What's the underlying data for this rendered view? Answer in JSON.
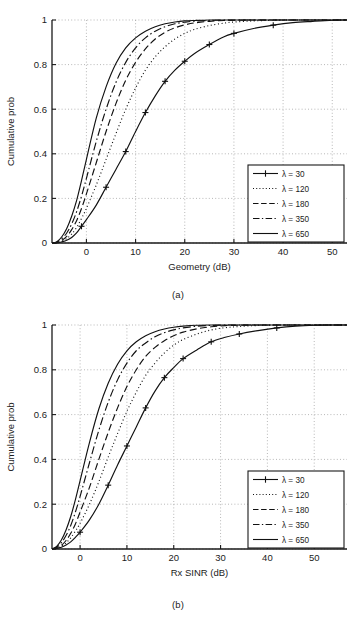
{
  "figure": {
    "panels": [
      {
        "id": "a",
        "caption": "(a)",
        "xlabel": "Geometry (dB)",
        "ylabel": "Cumulative prob",
        "xticks": [
          "0",
          "10",
          "20",
          "30",
          "40",
          "50"
        ],
        "yticks": [
          "0",
          "0.2",
          "0.4",
          "0.6",
          "0.8",
          "1"
        ]
      },
      {
        "id": "b",
        "caption": "(b)",
        "xlabel": "Rx SINR (dB)",
        "ylabel": "Cumulative prob",
        "xticks": [
          "0",
          "10",
          "20",
          "30",
          "40",
          "50"
        ],
        "yticks": [
          "0",
          "0.2",
          "0.4",
          "0.6",
          "0.8",
          "1"
        ]
      }
    ],
    "legend": {
      "entries": [
        {
          "label": "λ = 30",
          "style": "solid-plus"
        },
        {
          "label": "λ = 120",
          "style": "dotted"
        },
        {
          "label": "λ = 180",
          "style": "dashed"
        },
        {
          "label": "λ = 350",
          "style": "dashdot"
        },
        {
          "label": "λ = 650",
          "style": "solid"
        }
      ]
    },
    "colors": {
      "line": "#111111",
      "grid": "#9a9a9a",
      "axis": "#1a1a1a",
      "background": "#ffffff"
    }
  },
  "chart_data": [
    {
      "type": "line",
      "title": "(a)",
      "xlabel": "Geometry (dB)",
      "ylabel": "Cumulative prob",
      "xlim": [
        -7,
        53
      ],
      "ylim": [
        0,
        1
      ],
      "xticks": [
        0,
        10,
        20,
        30,
        40,
        50
      ],
      "yticks": [
        0,
        0.2,
        0.4,
        0.6,
        0.8,
        1
      ],
      "grid": true,
      "legend_position": "lower-right",
      "x": [
        -7,
        -6,
        -5,
        -4,
        -3,
        -2,
        -1,
        0,
        2,
        4,
        6,
        8,
        10,
        12,
        14,
        16,
        18,
        20,
        22,
        25,
        28,
        30,
        34,
        38,
        42,
        46,
        50,
        53
      ],
      "series": [
        {
          "name": "λ = 30",
          "style": "solid with plus markers",
          "values": [
            0.0,
            0.0,
            0.005,
            0.012,
            0.025,
            0.045,
            0.075,
            0.105,
            0.17,
            0.25,
            0.33,
            0.41,
            0.5,
            0.585,
            0.66,
            0.725,
            0.775,
            0.815,
            0.85,
            0.89,
            0.925,
            0.94,
            0.962,
            0.977,
            0.988,
            0.994,
            0.999,
            1.0
          ]
        },
        {
          "name": "λ = 120",
          "style": "dotted",
          "values": [
            0.0,
            0.0,
            0.008,
            0.02,
            0.04,
            0.07,
            0.11,
            0.155,
            0.26,
            0.375,
            0.49,
            0.6,
            0.695,
            0.775,
            0.835,
            0.88,
            0.915,
            0.94,
            0.958,
            0.975,
            0.986,
            0.991,
            0.996,
            0.999,
            1.0,
            1.0,
            1.0,
            1.0
          ]
        },
        {
          "name": "λ = 180",
          "style": "dashed",
          "values": [
            0.0,
            0.002,
            0.012,
            0.03,
            0.06,
            0.1,
            0.155,
            0.22,
            0.36,
            0.5,
            0.625,
            0.73,
            0.81,
            0.87,
            0.915,
            0.945,
            0.965,
            0.978,
            0.987,
            0.994,
            0.998,
            0.999,
            1.0,
            1.0,
            1.0,
            1.0,
            1.0,
            1.0
          ]
        },
        {
          "name": "λ = 350",
          "style": "dash-dot",
          "values": [
            0.0,
            0.004,
            0.02,
            0.045,
            0.085,
            0.14,
            0.21,
            0.29,
            0.455,
            0.6,
            0.72,
            0.81,
            0.875,
            0.92,
            0.95,
            0.97,
            0.983,
            0.99,
            0.995,
            0.998,
            1.0,
            1.0,
            1.0,
            1.0,
            1.0,
            1.0,
            1.0,
            1.0
          ]
        },
        {
          "name": "λ = 650",
          "style": "solid",
          "values": [
            0.0,
            0.006,
            0.028,
            0.065,
            0.12,
            0.19,
            0.28,
            0.375,
            0.56,
            0.7,
            0.805,
            0.875,
            0.92,
            0.95,
            0.97,
            0.983,
            0.991,
            0.996,
            0.998,
            1.0,
            1.0,
            1.0,
            1.0,
            1.0,
            1.0,
            1.0,
            1.0,
            1.0
          ]
        }
      ]
    },
    {
      "type": "line",
      "title": "(b)",
      "xlabel": "Rx SINR (dB)",
      "ylabel": "Cumulative prob",
      "xlim": [
        -6,
        57
      ],
      "ylim": [
        0,
        1
      ],
      "xticks": [
        0,
        10,
        20,
        30,
        40,
        50
      ],
      "yticks": [
        0,
        0.2,
        0.4,
        0.6,
        0.8,
        1
      ],
      "grid": true,
      "legend_position": "lower-right",
      "x": [
        -6,
        -5,
        -4,
        -3,
        -2,
        -1,
        0,
        2,
        4,
        6,
        8,
        10,
        12,
        14,
        16,
        18,
        20,
        22,
        25,
        28,
        31,
        34,
        38,
        42,
        46,
        50,
        54,
        57
      ],
      "series": [
        {
          "name": "λ = 30",
          "style": "solid with plus markers",
          "values": [
            0.0,
            0.002,
            0.008,
            0.018,
            0.032,
            0.052,
            0.075,
            0.13,
            0.2,
            0.285,
            0.375,
            0.46,
            0.545,
            0.63,
            0.705,
            0.765,
            0.81,
            0.85,
            0.89,
            0.925,
            0.945,
            0.96,
            0.975,
            0.987,
            0.995,
            0.999,
            1.0,
            1.0
          ]
        },
        {
          "name": "λ = 120",
          "style": "dotted",
          "values": [
            0.0,
            0.003,
            0.012,
            0.027,
            0.05,
            0.08,
            0.115,
            0.2,
            0.3,
            0.41,
            0.515,
            0.615,
            0.7,
            0.775,
            0.83,
            0.875,
            0.91,
            0.935,
            0.96,
            0.978,
            0.988,
            0.993,
            0.998,
            1.0,
            1.0,
            1.0,
            1.0,
            1.0
          ]
        },
        {
          "name": "λ = 180",
          "style": "dashed",
          "values": [
            0.0,
            0.004,
            0.016,
            0.038,
            0.07,
            0.112,
            0.165,
            0.275,
            0.4,
            0.52,
            0.63,
            0.725,
            0.8,
            0.86,
            0.9,
            0.93,
            0.952,
            0.968,
            0.983,
            0.992,
            0.997,
            0.999,
            1.0,
            1.0,
            1.0,
            1.0,
            1.0,
            1.0
          ]
        },
        {
          "name": "λ = 350",
          "style": "dash-dot",
          "values": [
            0.0,
            0.008,
            0.028,
            0.06,
            0.105,
            0.165,
            0.235,
            0.385,
            0.53,
            0.655,
            0.755,
            0.83,
            0.885,
            0.92,
            0.948,
            0.966,
            0.978,
            0.987,
            0.995,
            0.998,
            1.0,
            1.0,
            1.0,
            1.0,
            1.0,
            1.0,
            1.0,
            1.0
          ]
        },
        {
          "name": "λ = 650",
          "style": "solid",
          "values": [
            0.0,
            0.012,
            0.04,
            0.085,
            0.145,
            0.22,
            0.305,
            0.475,
            0.625,
            0.74,
            0.825,
            0.885,
            0.925,
            0.952,
            0.97,
            0.982,
            0.99,
            0.995,
            0.999,
            1.0,
            1.0,
            1.0,
            1.0,
            1.0,
            1.0,
            1.0,
            1.0,
            1.0
          ]
        }
      ]
    }
  ]
}
